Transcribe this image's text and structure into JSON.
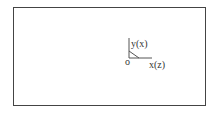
{
  "diagram": {
    "axes": {
      "vertical_label": "y(x)",
      "horizontal_label": "x(z)",
      "origin_label": "o"
    },
    "colors": {
      "frame": "#444444",
      "axis": "#555555",
      "text": "#333333"
    }
  }
}
